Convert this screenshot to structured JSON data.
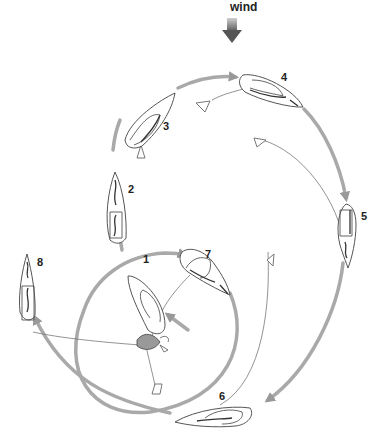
{
  "wind": {
    "label": "wind"
  },
  "positions": [
    {
      "n": "1",
      "label": "1"
    },
    {
      "n": "2",
      "label": "2"
    },
    {
      "n": "3",
      "label": "3"
    },
    {
      "n": "4",
      "label": "4"
    },
    {
      "n": "5",
      "label": "5"
    },
    {
      "n": "6",
      "label": "6"
    },
    {
      "n": "7",
      "label": "7"
    },
    {
      "n": "8",
      "label": "8"
    }
  ],
  "colors": {
    "track": "#a9a9a9",
    "wind_arrow": "#666666",
    "outline": "#555555"
  }
}
